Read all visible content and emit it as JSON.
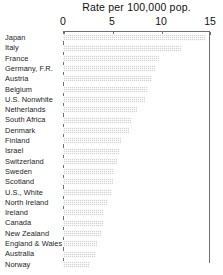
{
  "chart_data": {
    "type": "bar",
    "orientation": "horizontal",
    "title": "Rate per 100,000 pop.",
    "xlabel": "",
    "ylabel": "",
    "xlim": [
      0,
      15
    ],
    "xticks": [
      0,
      5,
      10,
      15
    ],
    "xtick_labels": [
      "0",
      "5",
      "10",
      "15"
    ],
    "grid": false,
    "legend": null,
    "categories": [
      "Japan",
      "Italy",
      "France",
      "Germany, F.R.",
      "Austria",
      "Belgium",
      "U.S. Nonwhite",
      "Netherlands",
      "South Africa",
      "Denmark",
      "Finland",
      "Israel",
      "Switzerland",
      "Sweden",
      "Scotland",
      "U.S., White",
      "North Ireland",
      "Ireland",
      "Canada",
      "New Zealand",
      "England & Wales",
      "Australia",
      "Norway"
    ],
    "values": [
      14.6,
      12.1,
      9.8,
      9.5,
      9.1,
      8.7,
      8.4,
      7.6,
      6.9,
      6.7,
      5.9,
      5.7,
      5.5,
      5.2,
      5.1,
      5.0,
      4.6,
      4.2,
      4.1,
      4.0,
      3.5,
      3.4,
      2.8
    ],
    "colors": {
      "bar_fill": "#d3d3d3",
      "axis": "#6f6f6f",
      "text": "#1a1a1a",
      "background": "#ffffff"
    }
  }
}
